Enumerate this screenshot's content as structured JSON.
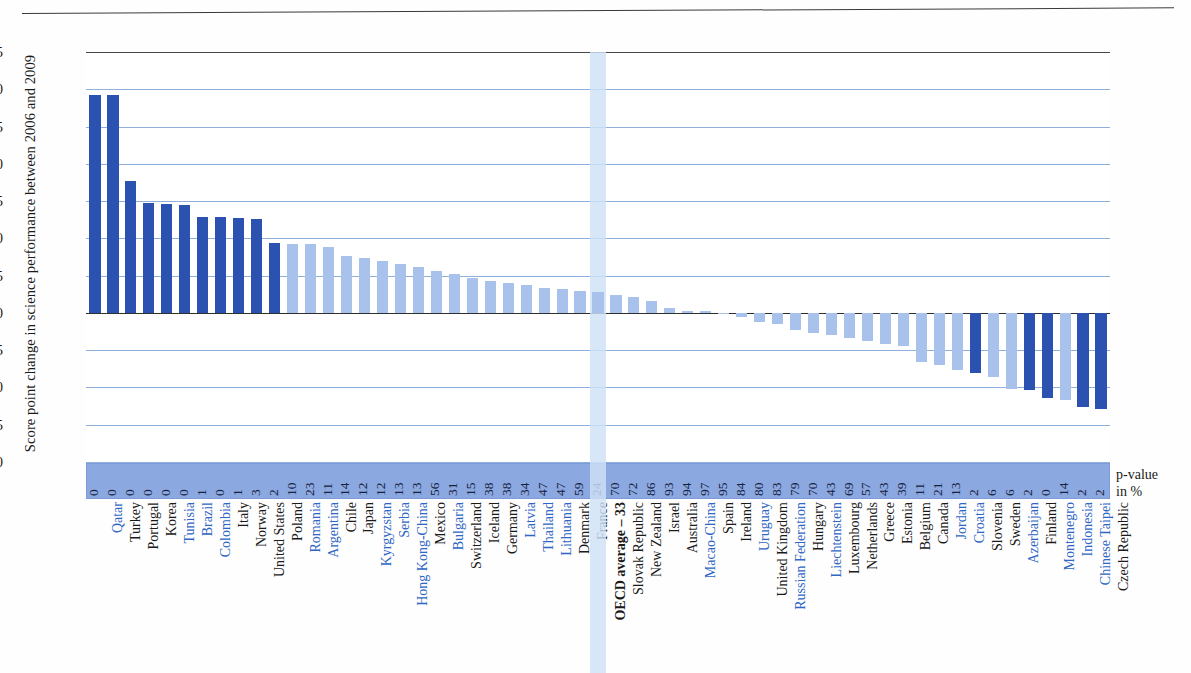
{
  "figure": {
    "y_axis_title": "Score point change in science performance between 2006 and 2009",
    "pvalue_legend_line1": "p-value",
    "pvalue_legend_line2": "in %"
  },
  "colors": {
    "significant": "#2b52b0",
    "not_significant": "#a8c2ec",
    "oecd_band": "#cfe2f7",
    "pstrip": "#8ca8e0",
    "gridline": "#8fb0dd",
    "highlight_label": "#2f66c4"
  },
  "chart_data": {
    "type": "bar",
    "title": "Change in science performance between 2006 and 2009",
    "xlabel": "",
    "ylabel": "Score point change in science performance between 2006 and 2009",
    "ylim": [
      -20,
      35
    ],
    "yticks": [
      35,
      30,
      25,
      20,
      15,
      10,
      5,
      0,
      -5,
      -10,
      -15,
      -20
    ],
    "grid": true,
    "legend": "none",
    "annotation": "p-value in %",
    "categories": [
      "Qatar",
      "Turkey",
      "Portugal",
      "Korea",
      "Tunisia",
      "Brazil",
      "Colombia",
      "Italy",
      "Norway",
      "United States",
      "Poland",
      "Romania",
      "Argentina",
      "Chile",
      "Japan",
      "Kyrgyzstan",
      "Serbia",
      "Hong Kong-China",
      "Mexico",
      "Bulgaria",
      "Switzerland",
      "Iceland",
      "Germany",
      "Latvia",
      "Thailand",
      "Lithuania",
      "Denmark",
      "France",
      "OECD average – 33",
      "Slovak Republic",
      "New Zealand",
      "Israel",
      "Australia",
      "Macao-China",
      "Spain",
      "Ireland",
      "Uruguay",
      "United Kingdom",
      "Russian Federation",
      "Hungary",
      "Liechtenstein",
      "Luxembourg",
      "Netherlands",
      "Greece",
      "Estonia",
      "Belgium",
      "Canada",
      "Jordan",
      "Croatia",
      "Slovenia",
      "Sweden",
      "Azerbaijan",
      "Finland",
      "Montenegro",
      "Indonesia",
      "Chinese Taipei",
      "Czech Republic"
    ],
    "values": [
      29.2,
      29.2,
      17.7,
      14.8,
      14.6,
      14.5,
      12.9,
      12.8,
      12.7,
      12.6,
      9.4,
      9.3,
      9.2,
      8.9,
      7.6,
      7.3,
      7.0,
      6.6,
      6.2,
      5.6,
      5.2,
      4.7,
      4.3,
      4.0,
      3.7,
      3.4,
      3.2,
      3.0,
      2.8,
      2.4,
      2.1,
      1.6,
      0.7,
      0.3,
      0.2,
      0.0,
      -0.6,
      -1.2,
      -1.5,
      -2.3,
      -2.7,
      -3.0,
      -3.4,
      -3.8,
      -4.2,
      -4.5,
      -6.6,
      -7.0,
      -7.6,
      -8.0,
      -8.6,
      -10.2,
      -10.4,
      -11.4,
      -11.7,
      -12.6,
      -12.9
    ],
    "pvalues": [
      0,
      0,
      0,
      0,
      0,
      0,
      1,
      0,
      1,
      3,
      2,
      10,
      23,
      11,
      14,
      12,
      12,
      13,
      13,
      56,
      31,
      15,
      38,
      38,
      34,
      47,
      47,
      59,
      24,
      70,
      72,
      86,
      93,
      94,
      97,
      95,
      84,
      80,
      83,
      79,
      70,
      43,
      69,
      57,
      43,
      39,
      11,
      21,
      13,
      2,
      6,
      6,
      2,
      0,
      14,
      2,
      2
    ],
    "significant": [
      true,
      true,
      true,
      true,
      true,
      true,
      true,
      true,
      true,
      true,
      true,
      false,
      false,
      false,
      false,
      false,
      false,
      false,
      false,
      false,
      false,
      false,
      false,
      false,
      false,
      false,
      false,
      false,
      false,
      false,
      false,
      false,
      false,
      false,
      false,
      false,
      false,
      false,
      false,
      false,
      false,
      false,
      false,
      false,
      false,
      false,
      false,
      false,
      false,
      true,
      false,
      false,
      true,
      true,
      false,
      true,
      true
    ],
    "label_highlight": [
      true,
      false,
      false,
      false,
      true,
      true,
      true,
      false,
      false,
      false,
      false,
      true,
      true,
      false,
      false,
      true,
      true,
      true,
      false,
      true,
      false,
      false,
      false,
      true,
      true,
      true,
      false,
      false,
      false,
      false,
      false,
      false,
      false,
      true,
      false,
      false,
      true,
      false,
      true,
      false,
      true,
      false,
      false,
      false,
      false,
      false,
      false,
      true,
      true,
      false,
      false,
      true,
      false,
      true,
      true,
      true,
      false
    ],
    "oecd_index": 28
  }
}
